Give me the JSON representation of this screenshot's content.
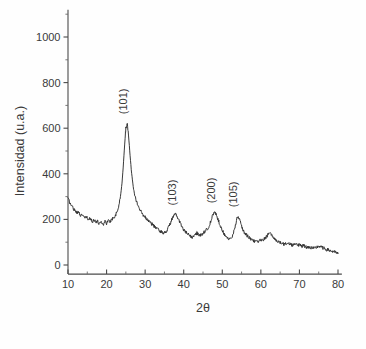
{
  "chart_data": {
    "type": "line",
    "title": "",
    "subtitle": "",
    "xlabel": "2θ",
    "ylabel": "Intensidad (u.a.)",
    "xlim": [
      8,
      81
    ],
    "ylim": [
      -40,
      1120
    ],
    "xticks": [
      10,
      20,
      30,
      40,
      50,
      60,
      70,
      80
    ],
    "xticklabels": [
      "10",
      "20",
      "30",
      "40",
      "50",
      "60",
      "70",
      "80"
    ],
    "yticks": [
      0,
      200,
      400,
      600,
      800,
      1000
    ],
    "yticklabels": [
      "0",
      "200",
      "400",
      "600",
      "800",
      "1000"
    ],
    "grid": false,
    "legend": null,
    "legend_position": "none",
    "series": [
      {
        "name": "XRD pattern",
        "color": "#2e2e2e",
        "x": [
          10.0,
          10.4,
          10.8,
          11.2,
          11.6,
          12.0,
          12.4,
          12.8,
          13.2,
          13.6,
          14.0,
          14.4,
          14.8,
          15.2,
          15.6,
          16.0,
          16.4,
          16.8,
          17.2,
          17.6,
          18.0,
          18.4,
          18.8,
          19.2,
          19.6,
          20.0,
          20.4,
          20.8,
          21.2,
          21.6,
          22.0,
          22.4,
          22.8,
          23.2,
          23.6,
          24.0,
          24.4,
          24.8,
          25.0,
          25.3,
          25.6,
          26.0,
          26.4,
          26.8,
          27.2,
          27.6,
          28.0,
          28.4,
          28.8,
          29.2,
          29.6,
          30.0,
          30.4,
          30.8,
          31.2,
          31.6,
          32.0,
          32.4,
          32.8,
          33.2,
          33.6,
          34.0,
          34.4,
          34.8,
          35.2,
          35.6,
          36.0,
          36.4,
          36.8,
          37.2,
          37.6,
          37.9,
          38.2,
          38.6,
          39.0,
          39.4,
          39.8,
          40.2,
          40.6,
          41.0,
          41.4,
          41.8,
          42.2,
          42.6,
          43.0,
          43.4,
          43.8,
          44.2,
          44.6,
          45.0,
          45.4,
          45.8,
          46.2,
          46.6,
          47.0,
          47.4,
          47.8,
          48.1,
          48.4,
          48.8,
          49.2,
          49.6,
          50.0,
          50.4,
          50.8,
          51.2,
          51.6,
          52.0,
          52.4,
          52.8,
          53.2,
          53.6,
          53.9,
          54.2,
          54.6,
          55.0,
          55.4,
          55.8,
          56.2,
          56.6,
          57.0,
          57.4,
          57.8,
          58.2,
          58.6,
          59.0,
          59.4,
          59.8,
          60.2,
          60.6,
          61.0,
          61.4,
          61.8,
          62.2,
          62.6,
          63.0,
          63.4,
          63.8,
          64.2,
          64.6,
          65.0,
          65.4,
          65.8,
          66.2,
          66.6,
          67.0,
          67.4,
          67.8,
          68.2,
          68.6,
          69.0,
          69.4,
          69.8,
          70.2,
          70.6,
          71.0,
          71.4,
          71.8,
          72.2,
          72.6,
          73.0,
          73.4,
          73.8,
          74.2,
          74.6,
          75.0,
          75.4,
          75.8,
          76.2,
          76.6,
          77.0,
          77.4,
          77.8,
          78.2,
          78.6,
          79.0,
          79.4,
          79.8,
          80.0
        ],
        "y": [
          292,
          276,
          262,
          255,
          243,
          238,
          228,
          233,
          220,
          214,
          218,
          206,
          210,
          199,
          204,
          196,
          192,
          199,
          188,
          193,
          182,
          190,
          186,
          178,
          192,
          183,
          196,
          188,
          198,
          205,
          212,
          222,
          238,
          262,
          300,
          360,
          450,
          560,
          600,
          622,
          590,
          500,
          420,
          360,
          318,
          290,
          268,
          250,
          238,
          228,
          218,
          210,
          202,
          196,
          188,
          182,
          176,
          170,
          164,
          158,
          152,
          148,
          143,
          140,
          144,
          152,
          163,
          178,
          196,
          210,
          219,
          222,
          216,
          203,
          188,
          172,
          160,
          150,
          142,
          136,
          130,
          126,
          122,
          126,
          133,
          140,
          136,
          130,
          134,
          140,
          146,
          152,
          160,
          172,
          190,
          212,
          226,
          231,
          222,
          205,
          186,
          168,
          152,
          140,
          130,
          122,
          116,
          112,
          118,
          134,
          158,
          190,
          214,
          210,
          192,
          170,
          152,
          140,
          132,
          126,
          120,
          115,
          110,
          106,
          103,
          100,
          104,
          108,
          106,
          110,
          116,
          124,
          132,
          138,
          134,
          126,
          118,
          112,
          106,
          102,
          98,
          95,
          92,
          90,
          93,
          97,
          94,
          90,
          88,
          91,
          95,
          92,
          88,
          85,
          83,
          86,
          82,
          79,
          77,
          80,
          76,
          74,
          72,
          75,
          79,
          83,
          80,
          77,
          74,
          71,
          68,
          66,
          64,
          62,
          60,
          57,
          55,
          52,
          50
        ]
      }
    ],
    "annotations": [
      {
        "label": "(101)",
        "x": 25.3,
        "y": 622,
        "rotation": -90
      },
      {
        "label": "(103)",
        "x": 37.9,
        "y": 222,
        "rotation": -90
      },
      {
        "label": "(200)",
        "x": 48.1,
        "y": 231,
        "rotation": -90
      },
      {
        "label": "(105)",
        "x": 53.9,
        "y": 214,
        "rotation": -90
      }
    ],
    "colors": {
      "trace": "#2e2e2e",
      "axis": "#4a4a4a",
      "text": "#3a3a3a",
      "background": "#fefefe"
    }
  }
}
